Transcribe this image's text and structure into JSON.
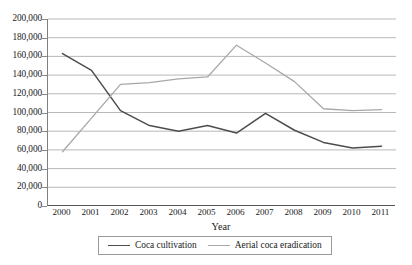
{
  "chart_data": {
    "type": "line",
    "title": "",
    "xlabel": "Year",
    "ylabel": "",
    "categories": [
      "2000",
      "2001",
      "2002",
      "2003",
      "2004",
      "2005",
      "2006",
      "2007",
      "2008",
      "2009",
      "2010",
      "2011"
    ],
    "x": [
      2000,
      2001,
      2002,
      2003,
      2004,
      2005,
      2006,
      2007,
      2008,
      2009,
      2010,
      2011
    ],
    "ylim": [
      0,
      200000
    ],
    "ytick_step": 20000,
    "yticks": [
      0,
      20000,
      40000,
      60000,
      80000,
      100000,
      120000,
      140000,
      160000,
      180000,
      200000
    ],
    "ytick_labels": [
      "0",
      "20,000",
      "40,000",
      "60,000",
      "80,000",
      "100,000",
      "120,000",
      "140,000",
      "160,000",
      "180,000",
      "200,000"
    ],
    "grid": "horizontal",
    "legend_position": "bottom",
    "series": [
      {
        "name": "Coca cultivation",
        "color": "#4d4d4d",
        "values": [
          163000,
          145000,
          102000,
          86000,
          80000,
          86000,
          78000,
          99000,
          81000,
          68000,
          62000,
          64000
        ]
      },
      {
        "name": "Aerial coca eradication",
        "color": "#a8a8a8",
        "values": [
          58000,
          94000,
          130000,
          132000,
          136000,
          138000,
          172000,
          153000,
          133000,
          104000,
          102000,
          103000
        ]
      }
    ]
  },
  "axis": {
    "x_title": "Year"
  },
  "legend": {
    "items": [
      {
        "label": "Coca cultivation"
      },
      {
        "label": "Aerial coca eradication"
      }
    ]
  }
}
